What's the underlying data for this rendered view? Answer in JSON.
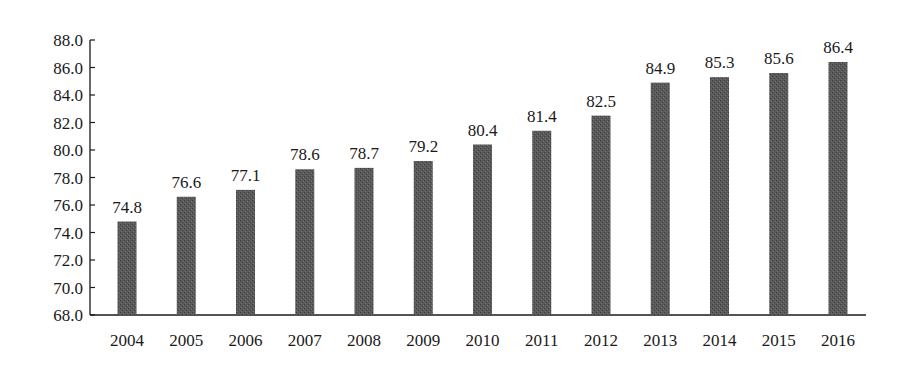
{
  "chart_data": {
    "type": "bar",
    "title": "",
    "xlabel": "",
    "ylabel": "",
    "categories": [
      "2004",
      "2005",
      "2006",
      "2007",
      "2008",
      "2009",
      "2010",
      "2011",
      "2012",
      "2013",
      "2014",
      "2015",
      "2016"
    ],
    "values": [
      74.8,
      76.6,
      77.1,
      78.6,
      78.7,
      79.2,
      80.4,
      81.4,
      82.5,
      84.9,
      85.3,
      85.6,
      86.4
    ],
    "value_labels": [
      "74.8",
      "76.6",
      "77.1",
      "78.6",
      "78.7",
      "79.2",
      "80.4",
      "81.4",
      "82.5",
      "84.9",
      "85.3",
      "85.6",
      "86.4"
    ],
    "ylim": [
      68.0,
      88.0
    ],
    "yticks": [
      "68.0",
      "70.0",
      "72.0",
      "74.0",
      "76.0",
      "78.0",
      "80.0",
      "82.0",
      "84.0",
      "86.0",
      "88.0"
    ],
    "grid": false,
    "legend": null,
    "bar_color": "#555555"
  }
}
